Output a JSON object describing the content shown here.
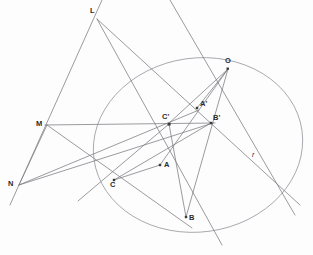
{
  "figure": {
    "background_color": "#fdfdfd",
    "stroke_color": "#7a7a80",
    "conic_color": "#9a9aa0",
    "label_color": "#2b2b2b"
  },
  "labels": {
    "L": "L",
    "M": "M",
    "N": "N",
    "O": "O",
    "A": "A",
    "B": "B",
    "C": "C",
    "A_prime": "A'",
    "B_prime": "B'",
    "C_prime": "C'",
    "r": "r"
  },
  "points": [
    {
      "name": "L",
      "label": "L",
      "x": 97,
      "y": 19,
      "label_x": 90,
      "label_y": 7,
      "dot": false
    },
    {
      "name": "M",
      "label": "M",
      "x": 47,
      "y": 125,
      "label_x": 37,
      "label_y": 120,
      "dot": false
    },
    {
      "name": "N",
      "label": "N",
      "x": 19,
      "y": 185,
      "label_x": 9,
      "label_y": 180,
      "dot": false
    },
    {
      "name": "O",
      "label": "O",
      "x": 228,
      "y": 69,
      "label_x": 225,
      "label_y": 58,
      "dot": true
    },
    {
      "name": "A",
      "label": "A",
      "x": 160,
      "y": 165,
      "label_x": 164,
      "label_y": 161,
      "dot": true
    },
    {
      "name": "B",
      "label": "B",
      "x": 186,
      "y": 217,
      "label_x": 189,
      "label_y": 214,
      "dot": true
    },
    {
      "name": "C",
      "label": "C",
      "x": 114,
      "y": 180,
      "label_x": 111,
      "label_y": 182,
      "dot": true
    },
    {
      "name": "A'",
      "label": "A'",
      "x": 197,
      "y": 108,
      "label_x": 200,
      "label_y": 101,
      "dot": true
    },
    {
      "name": "B'",
      "label": "B'",
      "x": 211,
      "y": 123,
      "label_x": 213,
      "label_y": 115,
      "dot": true
    },
    {
      "name": "C'",
      "label": "C'",
      "x": 169,
      "y": 124,
      "label_x": 163,
      "label_y": 114,
      "dot": true
    }
  ],
  "line_label": {
    "name": "r",
    "label": "r",
    "label_x": 252,
    "label_y": 152
  },
  "conic": {
    "type": "ellipse",
    "center_x": 198,
    "center_y": 145,
    "rx": 105,
    "ry": 87,
    "rotation_deg": -8
  },
  "segments": [
    {
      "name": "line-L-N-extended",
      "x1": 102,
      "y1": 0,
      "x2": 10,
      "y2": 205
    },
    {
      "name": "line-L-B-extended",
      "x1": 97,
      "y1": 19,
      "x2": 222,
      "y2": 245
    },
    {
      "name": "line-L-Bprime-extended",
      "x1": 97,
      "y1": 19,
      "x2": 300,
      "y2": 205
    },
    {
      "name": "line-N-to-Bprime",
      "x1": 19,
      "y1": 185,
      "x2": 213,
      "y2": 123
    },
    {
      "name": "line-N-to-Aprime",
      "x1": 19,
      "y1": 185,
      "x2": 199,
      "y2": 110
    },
    {
      "name": "line-N-to-M",
      "x1": 19,
      "y1": 185,
      "x2": 47,
      "y2": 125
    },
    {
      "name": "line-M-Cprime-Bprime-axis",
      "x1": 45,
      "y1": 125,
      "x2": 215,
      "y2": 123
    },
    {
      "name": "line-M-through-C-to-B",
      "x1": 47,
      "y1": 125,
      "x2": 192,
      "y2": 228
    },
    {
      "name": "line-O-to-A",
      "x1": 228,
      "y1": 69,
      "x2": 160,
      "y2": 165
    },
    {
      "name": "line-O-to-Cprime",
      "x1": 228,
      "y1": 69,
      "x2": 167,
      "y2": 125
    },
    {
      "name": "line-O-to-B",
      "x1": 228,
      "y1": 69,
      "x2": 186,
      "y2": 217
    },
    {
      "name": "line-O-to-Aprime",
      "x1": 228,
      "y1": 69,
      "x2": 197,
      "y2": 108
    },
    {
      "name": "line-r-through-O",
      "x1": 170,
      "y1": 0,
      "x2": 295,
      "y2": 215
    },
    {
      "name": "line-Cprime-to-B",
      "x1": 169,
      "y1": 124,
      "x2": 186,
      "y2": 217
    },
    {
      "name": "line-C-to-A",
      "x1": 114,
      "y1": 180,
      "x2": 160,
      "y2": 165
    },
    {
      "name": "line-C-to-Bprime",
      "x1": 114,
      "y1": 180,
      "x2": 211,
      "y2": 123
    },
    {
      "name": "line-Cprime-to-C-extended",
      "x1": 169,
      "y1": 124,
      "x2": 78,
      "y2": 201
    }
  ]
}
